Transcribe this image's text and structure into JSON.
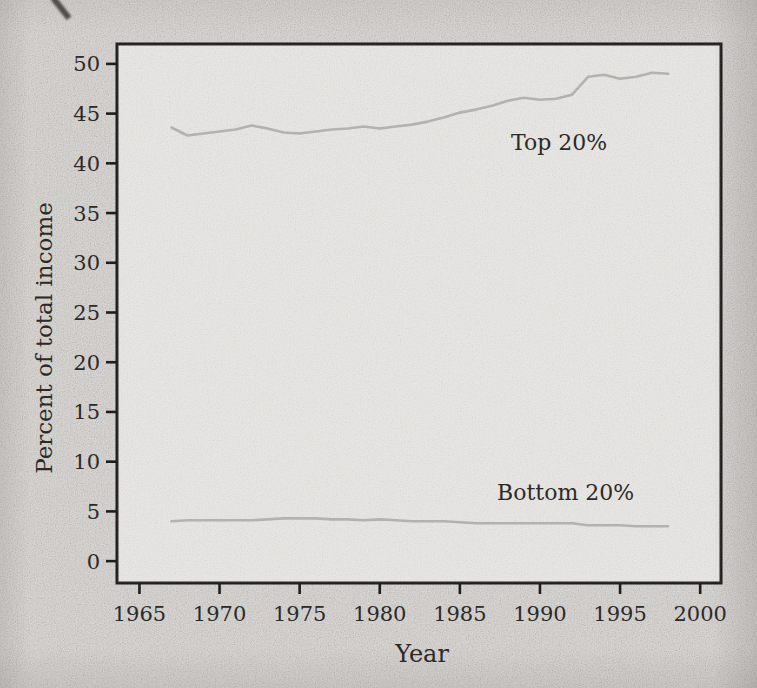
{
  "figure": {
    "background_color": "#d5d2ce",
    "plot_background_color": "#e8e7e4",
    "axis_color": "#1f1e1c",
    "line_color": "#b2b3af",
    "text_color": "#2c2a27"
  },
  "chart_data": {
    "type": "line",
    "title": "",
    "xlabel": "Year",
    "ylabel": "Percent of total income",
    "xlim": [
      1963.6,
      2001.3
    ],
    "ylim": [
      -2.2,
      52.0
    ],
    "x_ticks": [
      1965,
      1970,
      1975,
      1980,
      1985,
      1990,
      1995,
      2000
    ],
    "y_ticks": [
      0,
      5,
      10,
      15,
      20,
      25,
      30,
      35,
      40,
      45,
      50
    ],
    "grid": false,
    "legend": "inline-labels",
    "x": [
      1967,
      1968,
      1969,
      1970,
      1971,
      1972,
      1973,
      1974,
      1975,
      1976,
      1977,
      1978,
      1979,
      1980,
      1981,
      1982,
      1983,
      1984,
      1985,
      1986,
      1987,
      1988,
      1989,
      1990,
      1991,
      1992,
      1993,
      1994,
      1995,
      1996,
      1997,
      1998
    ],
    "series": [
      {
        "name": "Top 20%",
        "values": [
          43.6,
          42.8,
          43.0,
          43.2,
          43.4,
          43.8,
          43.5,
          43.1,
          43.0,
          43.2,
          43.4,
          43.5,
          43.7,
          43.5,
          43.7,
          43.9,
          44.2,
          44.6,
          45.1,
          45.4,
          45.8,
          46.3,
          46.6,
          46.4,
          46.5,
          46.9,
          48.7,
          48.9,
          48.5,
          48.7,
          49.1,
          49.0
        ]
      },
      {
        "name": "Bottom 20%",
        "values": [
          4.0,
          4.1,
          4.1,
          4.1,
          4.1,
          4.1,
          4.2,
          4.3,
          4.3,
          4.3,
          4.2,
          4.2,
          4.1,
          4.2,
          4.1,
          4.0,
          4.0,
          4.0,
          3.9,
          3.8,
          3.8,
          3.8,
          3.8,
          3.8,
          3.8,
          3.8,
          3.6,
          3.6,
          3.6,
          3.5,
          3.5,
          3.5
        ]
      }
    ],
    "annotations": [
      {
        "text": "Top 20%",
        "year": 1991.2,
        "value": 41.9
      },
      {
        "text": "Bottom 20%",
        "year": 1991.6,
        "value": 6.7
      }
    ]
  }
}
